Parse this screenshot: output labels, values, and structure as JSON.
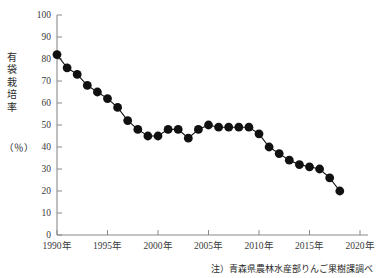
{
  "chart_data": {
    "type": "line",
    "title": "",
    "subtitle": "",
    "xlabel": "",
    "ylabel": "有袋栽培率（％）",
    "ylabel_main": "有袋栽培率",
    "ylabel_unit": "（％）",
    "xlim": [
      1989,
      2021
    ],
    "ylim": [
      0,
      100
    ],
    "y_ticks": [
      0,
      10,
      20,
      30,
      40,
      50,
      60,
      70,
      80,
      90,
      100
    ],
    "y_tick_labels": [
      "0",
      "10",
      "20",
      "30",
      "40",
      "50",
      "60",
      "70",
      "80",
      "90",
      "100"
    ],
    "x_ticks": [
      1990,
      1995,
      2000,
      2005,
      2010,
      2015,
      2020
    ],
    "x_tick_labels": [
      "1990年",
      "1995年",
      "2000年",
      "2005年",
      "2010年",
      "2015年",
      "2020年"
    ],
    "grid": false,
    "legend": null,
    "marker": "filled-circle",
    "marker_color": "#111111",
    "line_color": "#111111",
    "axis_color": "#8a8a8a",
    "x": [
      1990,
      1991,
      1992,
      1993,
      1994,
      1995,
      1996,
      1997,
      1998,
      1999,
      2000,
      2001,
      2002,
      2003,
      2004,
      2005,
      2006,
      2007,
      2008,
      2009,
      2010,
      2011,
      2012,
      2013,
      2014,
      2015,
      2016,
      2017,
      2018
    ],
    "values": [
      82,
      76,
      73,
      68,
      65,
      62,
      58,
      52,
      48,
      45,
      45,
      48,
      48,
      44,
      48,
      50,
      49,
      49,
      49,
      49,
      46,
      40,
      37,
      34,
      32,
      31,
      30,
      26,
      20
    ],
    "annotations": [],
    "source_note": "注）青森県農林水産部りんご果樹課調べ"
  },
  "footnote": "注）青森県農林水産部りんご果樹課調べ"
}
